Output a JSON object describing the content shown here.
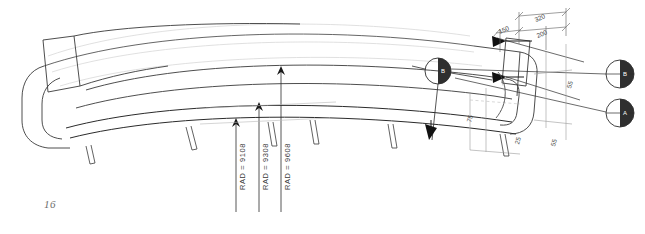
{
  "sheet": {
    "page_number": "16",
    "background_color": "#ffffff",
    "ink_color": "#2b2b2b",
    "faint_ink_color": "#c9c9c9"
  },
  "drawing": {
    "subject": "curved-sofa-plan-view",
    "radius_callouts": [
      {
        "name": "radius-callout-1",
        "text": "RAD = 9108",
        "value": 9108
      },
      {
        "name": "radius-callout-2",
        "text": "RAD = 9308",
        "value": 9308
      },
      {
        "name": "radius-callout-3",
        "text": "RAD = 9608",
        "value": 9608
      }
    ],
    "dimensions": [
      {
        "name": "dimension-150",
        "text": "150",
        "value": 150
      },
      {
        "name": "dimension-320",
        "text": "320",
        "value": 320
      },
      {
        "name": "dimension-200",
        "text": "200",
        "value": 200
      },
      {
        "name": "dimension-right-a",
        "text": "55",
        "value": 55
      },
      {
        "name": "dimension-right-b",
        "text": "75",
        "value": 75
      },
      {
        "name": "dimension-right-c",
        "text": "25",
        "value": 25
      },
      {
        "name": "dimension-right-d",
        "text": "55",
        "value": 55
      }
    ],
    "section_markers": [
      {
        "name": "section-marker-center",
        "label": "B"
      },
      {
        "name": "section-marker-upper-right",
        "label": "B"
      },
      {
        "name": "section-marker-lower-right",
        "label": "A"
      }
    ],
    "section_arrows": [
      {
        "name": "section-arrow-upper",
        "direction": "left"
      },
      {
        "name": "section-arrow-middle",
        "direction": "left"
      },
      {
        "name": "section-arrow-lower",
        "direction": "down"
      }
    ]
  }
}
